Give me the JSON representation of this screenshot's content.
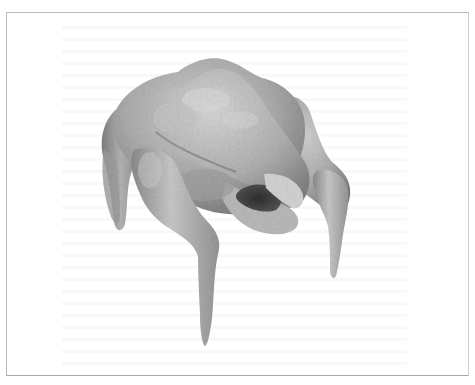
{
  "figure": {
    "background": "#ffffff",
    "frame_color": "#b9b9b9",
    "model_colors": {
      "light": "#d4d4d4",
      "mid": "#a6a6a6",
      "dark": "#6e6e6e",
      "shadow": "#3a3a3a"
    }
  }
}
